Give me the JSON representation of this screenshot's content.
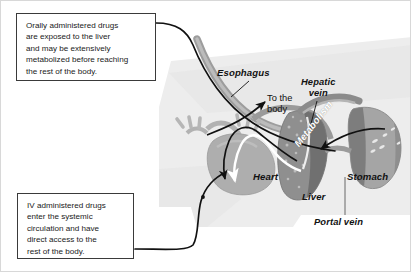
{
  "figure": {
    "type": "anatomical-diagram"
  },
  "callouts": [
    {
      "id": "oral",
      "text": "Orally administered drugs\nare exposed to the liver\nand may be extensively\nmetabolized before reaching\nthe rest of the body."
    },
    {
      "id": "iv",
      "text": "IV administered drugs\nenter the systemic\ncirculation and have\ndirect access to the\nrest of the body."
    }
  ],
  "labels": {
    "esophagus": "Esophagus",
    "hepatic_vein": "Hepatic\nvein",
    "to_the_body": "To the\nbody",
    "heart": "Heart",
    "metabolism": "Metabolism",
    "liver": "Liver",
    "stomach": "Stomach",
    "portal_vein": "Portal vein"
  },
  "colors": {
    "background": "#ffffff",
    "body_silhouette": "#ececec",
    "body_silhouette_alt": "#e2e2e2",
    "vessel_gray": "#9a9a9a",
    "vessel_light": "#b9b9b9",
    "heart_fill": "#aaaaaa",
    "liver_fill": "#8d8d8d",
    "liver_dark": "#6f6f6f",
    "stomach_fill": "#a3a3a3",
    "stomach_dark": "#7b7b7b",
    "route_line": "#111111",
    "callout_border": "#3a3a3a",
    "text": "#1a1a1a",
    "metabolism_text": "#ffffff"
  }
}
